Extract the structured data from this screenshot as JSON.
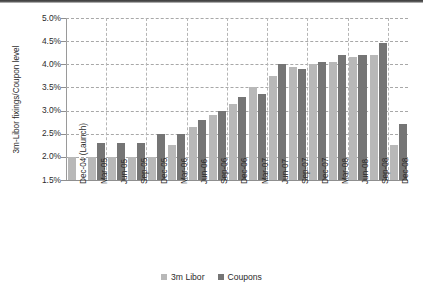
{
  "chart_data": {
    "type": "bar",
    "title": "",
    "xlabel": "",
    "ylabel": "3m-Libor fixings/Coupon level",
    "ylim": [
      1.5,
      5.0
    ],
    "ytick_labels": [
      "5.0%",
      "4.5%",
      "4.0%",
      "3.5%",
      "3.0%",
      "2.5%",
      "2.0%",
      "1.5%"
    ],
    "ytick_values": [
      5.0,
      4.5,
      4.0,
      3.5,
      3.0,
      2.5,
      2.0,
      1.5
    ],
    "grid": true,
    "legend_position": "bottom",
    "categories": [
      "Dec-04 (Launch)",
      "Mar-05",
      "Jun-05",
      "Sep-05",
      "Dec-05",
      "Mar-06",
      "Jun-06",
      "Sep-06",
      "Dec-06",
      "Mar-07",
      "Jun-07",
      "Sep-07",
      "Dec-07",
      "Mar-08",
      "Jun-08",
      "Sep-08",
      "Dec-08"
    ],
    "series": [
      {
        "name": "3m Libor",
        "color": "#b8b8b8",
        "values": [
          2.0,
          2.0,
          2.0,
          2.0,
          2.0,
          2.25,
          2.65,
          2.9,
          3.15,
          3.5,
          3.75,
          3.95,
          4.0,
          4.05,
          4.15,
          4.2,
          2.25
        ]
      },
      {
        "name": "Coupons",
        "color": "#757575",
        "values": [
          null,
          2.3,
          2.3,
          2.3,
          2.5,
          2.5,
          2.8,
          3.0,
          3.3,
          3.35,
          4.0,
          3.9,
          4.05,
          4.2,
          4.2,
          4.45,
          2.7
        ]
      }
    ]
  },
  "legend": {
    "items": [
      {
        "label": "3m Libor",
        "color": "#b8b8b8"
      },
      {
        "label": "Coupons",
        "color": "#757575"
      }
    ]
  }
}
